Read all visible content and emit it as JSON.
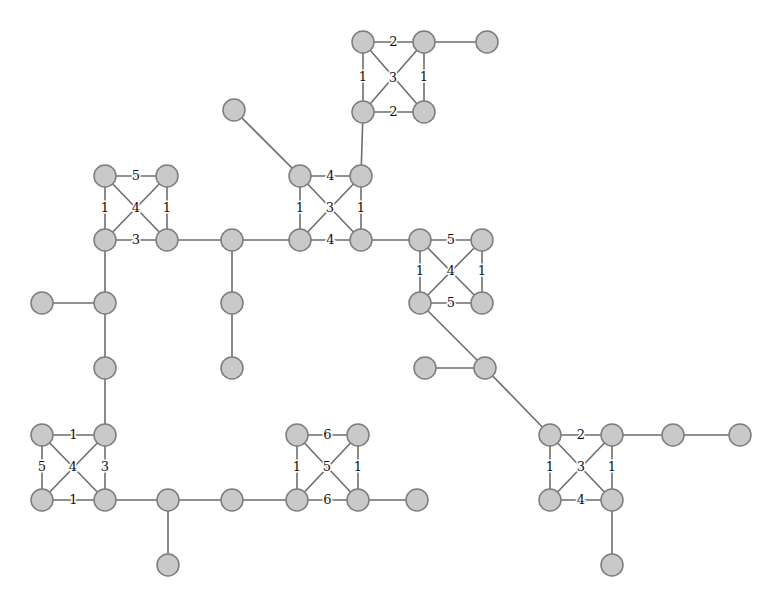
{
  "figure": {
    "type": "node-link-graph",
    "title": "",
    "background_color": "#ffffff",
    "node_fill_color": "#c9c9c9",
    "node_stroke_color": "#7d7d7d",
    "edge_color": "#6e6e6e",
    "label_color": "#111111",
    "node_radius": 11
  },
  "chart_data": {
    "type": "diagram",
    "title": "",
    "xlabel": "",
    "ylabel": "",
    "nodes": [
      {
        "id": "n1",
        "x": 363,
        "y": 42
      },
      {
        "id": "n2",
        "x": 424,
        "y": 42
      },
      {
        "id": "n3",
        "x": 487,
        "y": 42
      },
      {
        "id": "n4",
        "x": 363,
        "y": 112
      },
      {
        "id": "n5",
        "x": 424,
        "y": 112
      },
      {
        "id": "n6",
        "x": 234,
        "y": 110
      },
      {
        "id": "n7",
        "x": 300,
        "y": 176
      },
      {
        "id": "n8",
        "x": 361,
        "y": 176
      },
      {
        "id": "n9",
        "x": 300,
        "y": 240
      },
      {
        "id": "n10",
        "x": 361,
        "y": 240
      },
      {
        "id": "n11",
        "x": 105,
        "y": 176
      },
      {
        "id": "n12",
        "x": 167,
        "y": 176
      },
      {
        "id": "n13",
        "x": 105,
        "y": 240
      },
      {
        "id": "n14",
        "x": 167,
        "y": 240
      },
      {
        "id": "n15",
        "x": 232,
        "y": 240
      },
      {
        "id": "n16",
        "x": 232,
        "y": 303
      },
      {
        "id": "n17",
        "x": 232,
        "y": 368
      },
      {
        "id": "n18",
        "x": 42,
        "y": 303
      },
      {
        "id": "n19",
        "x": 105,
        "y": 303
      },
      {
        "id": "n20",
        "x": 105,
        "y": 368
      },
      {
        "id": "n21",
        "x": 42,
        "y": 435
      },
      {
        "id": "n22",
        "x": 105,
        "y": 435
      },
      {
        "id": "n23",
        "x": 42,
        "y": 500
      },
      {
        "id": "n24",
        "x": 105,
        "y": 500
      },
      {
        "id": "n25",
        "x": 168,
        "y": 500
      },
      {
        "id": "n26",
        "x": 168,
        "y": 565
      },
      {
        "id": "n27",
        "x": 232,
        "y": 500
      },
      {
        "id": "n28",
        "x": 297,
        "y": 435
      },
      {
        "id": "n29",
        "x": 358,
        "y": 435
      },
      {
        "id": "n30",
        "x": 297,
        "y": 500
      },
      {
        "id": "n31",
        "x": 358,
        "y": 500
      },
      {
        "id": "n32",
        "x": 417,
        "y": 500
      },
      {
        "id": "n33",
        "x": 420,
        "y": 240
      },
      {
        "id": "n34",
        "x": 482,
        "y": 240
      },
      {
        "id": "n35",
        "x": 420,
        "y": 303
      },
      {
        "id": "n36",
        "x": 482,
        "y": 303
      },
      {
        "id": "n37",
        "x": 425,
        "y": 368
      },
      {
        "id": "n38",
        "x": 485,
        "y": 368
      },
      {
        "id": "n39",
        "x": 550,
        "y": 435
      },
      {
        "id": "n40",
        "x": 612,
        "y": 435
      },
      {
        "id": "n41",
        "x": 673,
        "y": 435
      },
      {
        "id": "n42",
        "x": 740,
        "y": 435
      },
      {
        "id": "n43",
        "x": 550,
        "y": 500
      },
      {
        "id": "n44",
        "x": 612,
        "y": 500
      },
      {
        "id": "n45",
        "x": 612,
        "y": 565
      }
    ],
    "edges": [
      {
        "source": "n1",
        "target": "n2",
        "label": "2"
      },
      {
        "source": "n2",
        "target": "n3",
        "label": ""
      },
      {
        "source": "n1",
        "target": "n4",
        "label": "1"
      },
      {
        "source": "n2",
        "target": "n5",
        "label": "1"
      },
      {
        "source": "n4",
        "target": "n5",
        "label": "2"
      },
      {
        "source": "n1",
        "target": "n5",
        "label": "3"
      },
      {
        "source": "n2",
        "target": "n4",
        "label": ""
      },
      {
        "source": "n4",
        "target": "n8",
        "label": ""
      },
      {
        "source": "n6",
        "target": "n7",
        "label": ""
      },
      {
        "source": "n7",
        "target": "n8",
        "label": "4"
      },
      {
        "source": "n7",
        "target": "n9",
        "label": "1"
      },
      {
        "source": "n8",
        "target": "n10",
        "label": "1"
      },
      {
        "source": "n9",
        "target": "n10",
        "label": "4"
      },
      {
        "source": "n7",
        "target": "n10",
        "label": "3"
      },
      {
        "source": "n8",
        "target": "n9",
        "label": ""
      },
      {
        "source": "n11",
        "target": "n12",
        "label": "5"
      },
      {
        "source": "n11",
        "target": "n13",
        "label": "1"
      },
      {
        "source": "n12",
        "target": "n14",
        "label": "1"
      },
      {
        "source": "n13",
        "target": "n14",
        "label": "3"
      },
      {
        "source": "n11",
        "target": "n14",
        "label": "4"
      },
      {
        "source": "n12",
        "target": "n13",
        "label": ""
      },
      {
        "source": "n14",
        "target": "n15",
        "label": ""
      },
      {
        "source": "n15",
        "target": "n9",
        "label": ""
      },
      {
        "source": "n10",
        "target": "n33",
        "label": ""
      },
      {
        "source": "n15",
        "target": "n16",
        "label": ""
      },
      {
        "source": "n16",
        "target": "n17",
        "label": ""
      },
      {
        "source": "n13",
        "target": "n19",
        "label": ""
      },
      {
        "source": "n18",
        "target": "n19",
        "label": ""
      },
      {
        "source": "n19",
        "target": "n20",
        "label": ""
      },
      {
        "source": "n20",
        "target": "n22",
        "label": ""
      },
      {
        "source": "n21",
        "target": "n22",
        "label": "1"
      },
      {
        "source": "n21",
        "target": "n23",
        "label": "5"
      },
      {
        "source": "n22",
        "target": "n24",
        "label": "3"
      },
      {
        "source": "n23",
        "target": "n24",
        "label": "1"
      },
      {
        "source": "n21",
        "target": "n24",
        "label": "4"
      },
      {
        "source": "n22",
        "target": "n23",
        "label": ""
      },
      {
        "source": "n24",
        "target": "n25",
        "label": ""
      },
      {
        "source": "n25",
        "target": "n26",
        "label": ""
      },
      {
        "source": "n25",
        "target": "n27",
        "label": ""
      },
      {
        "source": "n27",
        "target": "n30",
        "label": ""
      },
      {
        "source": "n28",
        "target": "n29",
        "label": "6"
      },
      {
        "source": "n28",
        "target": "n30",
        "label": "1"
      },
      {
        "source": "n29",
        "target": "n31",
        "label": "1"
      },
      {
        "source": "n30",
        "target": "n31",
        "label": "6"
      },
      {
        "source": "n28",
        "target": "n31",
        "label": "5"
      },
      {
        "source": "n29",
        "target": "n30",
        "label": ""
      },
      {
        "source": "n31",
        "target": "n32",
        "label": ""
      },
      {
        "source": "n33",
        "target": "n34",
        "label": "5"
      },
      {
        "source": "n33",
        "target": "n35",
        "label": "1"
      },
      {
        "source": "n34",
        "target": "n36",
        "label": "1"
      },
      {
        "source": "n35",
        "target": "n36",
        "label": "5"
      },
      {
        "source": "n33",
        "target": "n36",
        "label": "4"
      },
      {
        "source": "n34",
        "target": "n35",
        "label": ""
      },
      {
        "source": "n35",
        "target": "n38",
        "label": ""
      },
      {
        "source": "n37",
        "target": "n38",
        "label": ""
      },
      {
        "source": "n38",
        "target": "n39",
        "label": ""
      },
      {
        "source": "n39",
        "target": "n40",
        "label": "2"
      },
      {
        "source": "n40",
        "target": "n41",
        "label": ""
      },
      {
        "source": "n41",
        "target": "n42",
        "label": ""
      },
      {
        "source": "n39",
        "target": "n43",
        "label": "1"
      },
      {
        "source": "n40",
        "target": "n44",
        "label": "1"
      },
      {
        "source": "n43",
        "target": "n44",
        "label": "4"
      },
      {
        "source": "n39",
        "target": "n44",
        "label": "3"
      },
      {
        "source": "n40",
        "target": "n43",
        "label": ""
      },
      {
        "source": "n44",
        "target": "n45",
        "label": ""
      }
    ],
    "label_overrides": [
      {
        "source": "n1",
        "target": "n5",
        "x": 393,
        "y": 78
      },
      {
        "source": "n7",
        "target": "n10",
        "x": 330,
        "y": 208
      },
      {
        "source": "n11",
        "target": "n14",
        "x": 136,
        "y": 208
      },
      {
        "source": "n21",
        "target": "n24",
        "x": 73,
        "y": 467
      },
      {
        "source": "n28",
        "target": "n31",
        "x": 327,
        "y": 467
      },
      {
        "source": "n33",
        "target": "n36",
        "x": 451,
        "y": 271
      },
      {
        "source": "n39",
        "target": "n44",
        "x": 581,
        "y": 467
      }
    ]
  }
}
